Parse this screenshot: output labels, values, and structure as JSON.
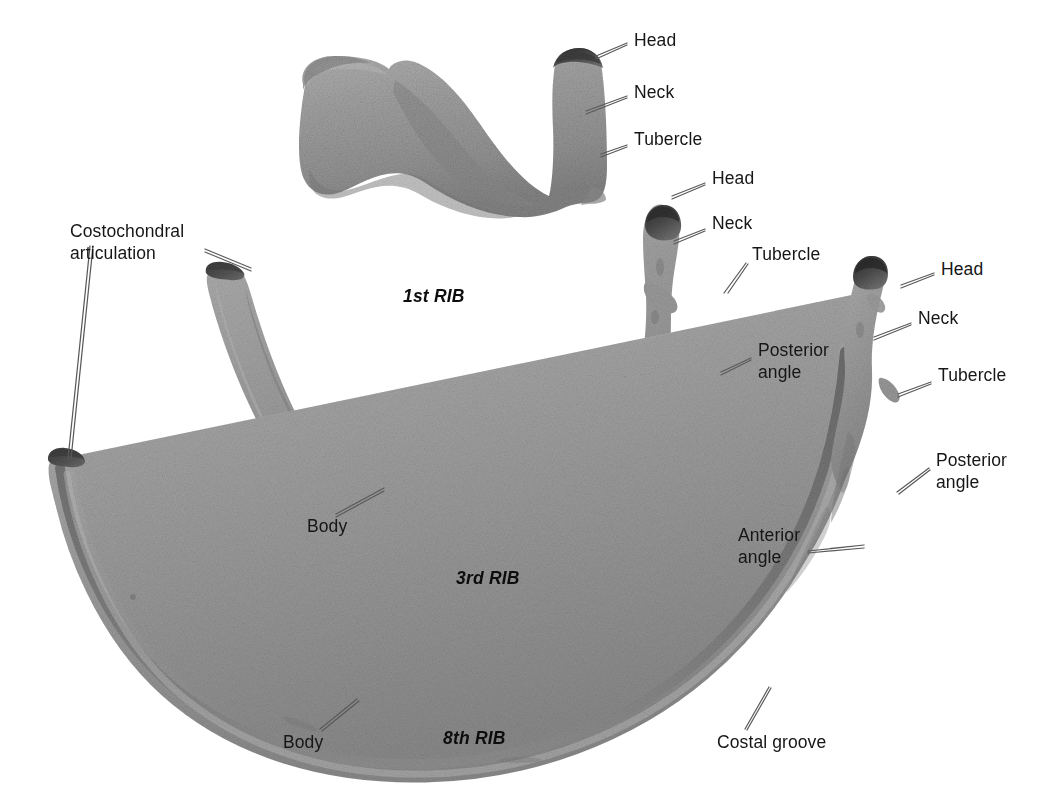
{
  "figure": {
    "background_color": "#ffffff",
    "text_color": "#161616",
    "leader_line_color": "#5a5a5a",
    "bone_light_color": "#a9a9a9",
    "bone_mid_color": "#989898",
    "bone_dark_color": "#6e6e6e",
    "bone_cut_end_color": "#4a4a4a"
  },
  "captions": [
    {
      "id": "rib1",
      "text": "1st RIB",
      "x": 403,
      "y": 297
    },
    {
      "id": "rib3",
      "text": "3rd RIB",
      "x": 456,
      "y": 579
    },
    {
      "id": "rib8",
      "text": "8th RIB",
      "x": 443,
      "y": 739
    }
  ],
  "labels": [
    {
      "id": "rib1-head",
      "text": "Head",
      "x": 634,
      "y": 36,
      "align": "left"
    },
    {
      "id": "rib1-neck",
      "text": "Neck",
      "x": 634,
      "y": 88,
      "align": "left"
    },
    {
      "id": "rib1-tubercle",
      "text": "Tubercle",
      "x": 634,
      "y": 135,
      "align": "left"
    },
    {
      "id": "rib3-head",
      "text": "Head",
      "x": 712,
      "y": 174,
      "align": "left"
    },
    {
      "id": "rib3-neck",
      "text": "Neck",
      "x": 712,
      "y": 219,
      "align": "left"
    },
    {
      "id": "rib3-tubercle",
      "text": "Tubercle",
      "x": 752,
      "y": 250,
      "align": "left"
    },
    {
      "id": "rib3-posterior",
      "text": "Posterior\nangle",
      "x": 758,
      "y": 346,
      "align": "left"
    },
    {
      "id": "rib8-head",
      "text": "Head",
      "x": 941,
      "y": 265,
      "align": "left"
    },
    {
      "id": "rib8-neck",
      "text": "Neck",
      "x": 918,
      "y": 314,
      "align": "left"
    },
    {
      "id": "rib8-tubercle",
      "text": "Tubercle",
      "x": 938,
      "y": 371,
      "align": "left"
    },
    {
      "id": "rib8-posterior",
      "text": "Posterior\nangle",
      "x": 936,
      "y": 456,
      "align": "left"
    },
    {
      "id": "rib8-anterior",
      "text": "Anterior\nangle",
      "x": 738,
      "y": 531,
      "align": "left"
    },
    {
      "id": "costochondral",
      "text": "Costochondral\narticulation",
      "x": 70,
      "y": 227,
      "align": "left"
    },
    {
      "id": "rib3-body",
      "text": "Body",
      "x": 307,
      "y": 522,
      "align": "left"
    },
    {
      "id": "rib8-body",
      "text": "Body",
      "x": 283,
      "y": 738,
      "align": "left"
    },
    {
      "id": "costal-groove",
      "text": "Costal groove",
      "x": 717,
      "y": 738,
      "align": "left"
    }
  ],
  "leader_lines": [
    {
      "id": "lead-rib1-head",
      "points": "627,43 596,56"
    },
    {
      "id": "lead-rib1-neck",
      "points": "627,96 586,111"
    },
    {
      "id": "lead-rib1-tubercle",
      "points": "627,145 601,154"
    },
    {
      "id": "lead-rib3-head",
      "points": "705,183 672,196"
    },
    {
      "id": "lead-rib3-neck",
      "points": "705,229 674,241"
    },
    {
      "id": "lead-rib3-tubercle",
      "points": "746,263 726,292"
    },
    {
      "id": "lead-rib3-posterior",
      "points": "751,358 721,372"
    },
    {
      "id": "lead-rib8-head",
      "points": "934,273 901,285"
    },
    {
      "id": "lead-rib8-neck",
      "points": "911,323 874,337"
    },
    {
      "id": "lead-rib8-tubercle",
      "points": "931,382 898,394"
    },
    {
      "id": "lead-rib8-posterior",
      "points": "929,468 897,492"
    },
    {
      "id": "lead-rib8-anterior",
      "points": "808,552 862,546"
    },
    {
      "id": "lead-costo-rib3",
      "points": "205,250 249,269"
    },
    {
      "id": "lead-costo-rib8",
      "points": "90,246 69,459"
    },
    {
      "id": "lead-rib3-body",
      "points": "336,515 384,489"
    },
    {
      "id": "lead-rib8-body",
      "points": "320,729 357,700"
    },
    {
      "id": "lead-costal-groove",
      "points": "745,729 769,688"
    }
  ],
  "ribs": [
    {
      "id": "rib-1",
      "name": "1st RIB",
      "parts": [
        "Head",
        "Neck",
        "Tubercle"
      ],
      "description": "Short, broad, flat and sharply curved rib shown from above"
    },
    {
      "id": "rib-3",
      "name": "3rd RIB",
      "parts": [
        "Head",
        "Neck",
        "Tubercle",
        "Posterior angle",
        "Body",
        "Costochondral articulation"
      ],
      "description": "Medium-length curved rib"
    },
    {
      "id": "rib-8",
      "name": "8th RIB",
      "parts": [
        "Head",
        "Neck",
        "Tubercle",
        "Posterior angle",
        "Anterior angle",
        "Body",
        "Costal groove",
        "Costochondral articulation"
      ],
      "description": "Long, slender, widely curved rib"
    }
  ]
}
